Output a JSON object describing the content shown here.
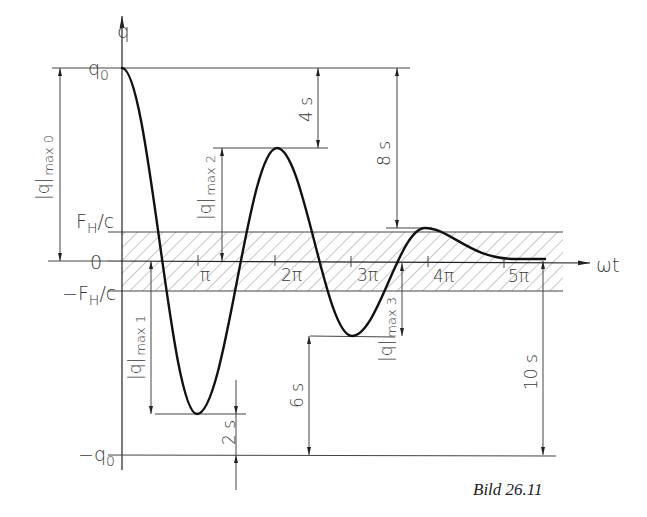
{
  "figure": {
    "caption": "Bild 26.11",
    "axes": {
      "y_label": "q",
      "x_label": "ωt",
      "y_ticks": [
        {
          "label": "q0",
          "main": "q",
          "sub": "0",
          "value": "q0"
        },
        {
          "label": "F_H/c",
          "main": "F",
          "sub": "H",
          "suffix": "/c",
          "value": "F_H/c"
        },
        {
          "label": "0",
          "value": "0"
        },
        {
          "label": "-F_H/c",
          "prefix": "−F",
          "sub": "H",
          "suffix": "/c",
          "value": "-F_H/c"
        },
        {
          "label": "-q0",
          "main": "−q",
          "sub": "0",
          "value": "-q0"
        }
      ],
      "x_ticks": [
        "π",
        "2π",
        "3π",
        "4π",
        "5π"
      ]
    },
    "band": {
      "description": "Hatched dead band between -F_H/c and +F_H/c",
      "upper": "F_H/c",
      "lower": "-F_H/c"
    },
    "amplitude_labels": [
      {
        "id": "max0",
        "main": "|q|",
        "sub": "max 0"
      },
      {
        "id": "max1",
        "main": "|q|",
        "sub": "max 1"
      },
      {
        "id": "max2",
        "main": "|q|",
        "sub": "max 2"
      },
      {
        "id": "max3",
        "main": "|q|",
        "sub": "max 3"
      }
    ],
    "dimensions": [
      {
        "id": "d2s",
        "label": "2 s"
      },
      {
        "id": "d4s",
        "label": "4 s"
      },
      {
        "id": "d6s",
        "label": "6 s"
      },
      {
        "id": "d8s",
        "label": "8 s"
      },
      {
        "id": "d10s",
        "label": "10 s"
      }
    ],
    "curve": {
      "type": "Coulomb-damped oscillation",
      "extrema": [
        {
          "omega_t": "0",
          "value": "q0"
        },
        {
          "omega_t": "π",
          "value": "-(q0 - 2s)"
        },
        {
          "omega_t": "2π",
          "value": "q0 - 4s"
        },
        {
          "omega_t": "3π",
          "value": "-(q0 - 6s)"
        },
        {
          "omega_t": "4π",
          "value": "q0 - 8s"
        },
        {
          "omega_t": "5π",
          "value": "rest within band"
        }
      ]
    }
  }
}
